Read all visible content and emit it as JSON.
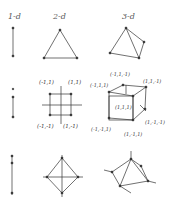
{
  "headers": [
    {
      "label": "1-d",
      "x": 8
    },
    {
      "label": "2-d",
      "x": 53
    },
    {
      "label": "3-d",
      "x": 122
    }
  ],
  "rows": [
    {
      "name": "simplex",
      "shapes": [
        "segment",
        "triangle",
        "tetrahedron"
      ]
    },
    {
      "name": "hypercube",
      "shapes": [
        "segment",
        "square",
        "cube"
      ]
    },
    {
      "name": "cross-polytope",
      "shapes": [
        "segment",
        "diamond",
        "octahedron"
      ]
    }
  ],
  "square_labels": [
    "(-1,1)",
    "(1,1)",
    "(-1,-1)",
    "(1,-1)"
  ],
  "cube_labels": [
    "(-1,1,-1)",
    "(-1,1,1)",
    "(1,1,-1)",
    "(1,1,1)",
    "(1,-1,-1)",
    "(-1,-1,1)",
    "(1,-1,1)"
  ],
  "colors": {
    "line": "#333333",
    "dot": "#222222"
  }
}
